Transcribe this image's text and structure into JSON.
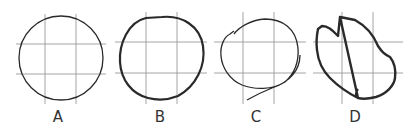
{
  "figure": {
    "panels": [
      {
        "label": "A",
        "description": "Reference circle drawn precisely on 3x3 grid",
        "stroke_width": 1.3
      },
      {
        "label": "B",
        "description": "Hand-drawn circle, near-accurate, thick stroke",
        "stroke_width": 2.2
      },
      {
        "label": "C",
        "description": "Hand-drawn circle, distorted with overshooting tail",
        "stroke_width": 1.3
      },
      {
        "label": "D",
        "description": "Hand-drawn irregular closed shape, thick stroke",
        "stroke_width": 2.4
      }
    ],
    "colors": {
      "grid": "#9a9a9a",
      "stroke": "#2a2a2a",
      "background": "#ffffff"
    }
  }
}
